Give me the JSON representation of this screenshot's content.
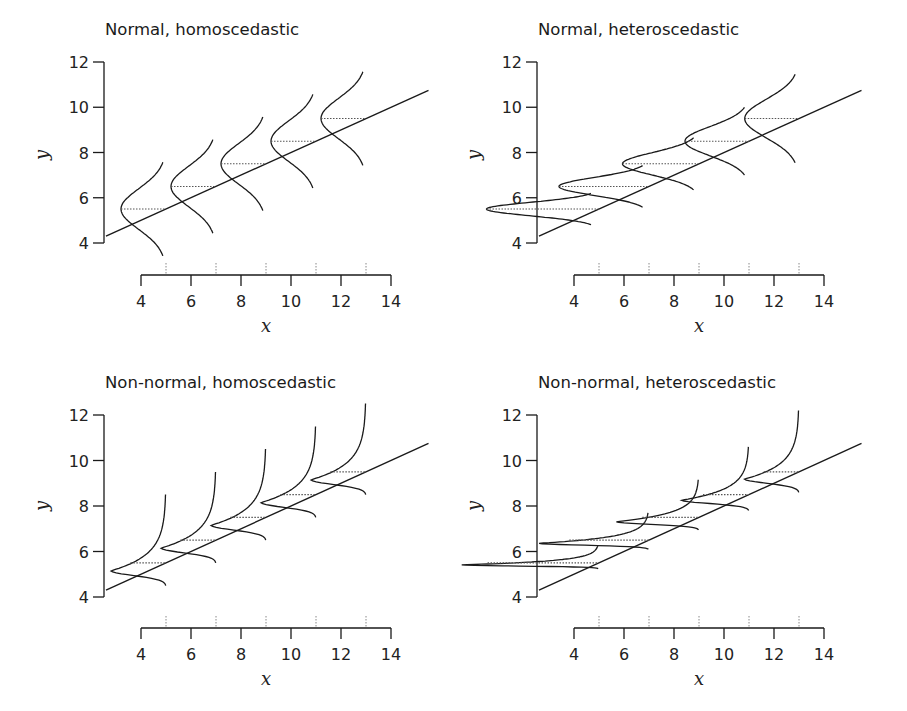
{
  "figure": {
    "background": "#ffffff",
    "line_color": "#1a1a1a",
    "dotted_color": "#555555"
  },
  "chart_data": [
    {
      "type": "line",
      "title": "Normal, homoscedastic",
      "xlabel": "x",
      "ylabel": "y",
      "xlim": [
        4,
        14
      ],
      "ylim": [
        4,
        12
      ],
      "xticks": [
        4,
        6,
        8,
        10,
        12,
        14
      ],
      "yticks": [
        4,
        6,
        8,
        10,
        12
      ],
      "grid": false,
      "regression_line": {
        "intercept": 3.0,
        "slope": 0.5,
        "x_range": [
          2.6,
          15.5
        ]
      },
      "distribution": "normal",
      "variance": "homoscedastic",
      "conditional_distributions": [
        {
          "x": 5,
          "mean": 5.5,
          "sd": 0.9
        },
        {
          "x": 7,
          "mean": 6.5,
          "sd": 0.9
        },
        {
          "x": 9,
          "mean": 7.5,
          "sd": 0.9
        },
        {
          "x": 11,
          "mean": 8.5,
          "sd": 0.9
        },
        {
          "x": 13,
          "mean": 9.5,
          "sd": 0.9
        }
      ],
      "rug_x": [
        5,
        7,
        9,
        11,
        13
      ]
    },
    {
      "type": "line",
      "title": "Normal, heteroscedastic",
      "xlabel": "x",
      "ylabel": "y",
      "xlim": [
        4,
        14
      ],
      "ylim": [
        4,
        12
      ],
      "xticks": [
        4,
        6,
        8,
        10,
        12,
        14
      ],
      "yticks": [
        4,
        6,
        8,
        10,
        12
      ],
      "grid": false,
      "regression_line": {
        "intercept": 3.0,
        "slope": 0.5,
        "x_range": [
          2.6,
          15.5
        ]
      },
      "distribution": "normal",
      "variance": "heteroscedastic",
      "conditional_distributions": [
        {
          "x": 5,
          "mean": 5.5,
          "sd": 0.3
        },
        {
          "x": 7,
          "mean": 6.5,
          "sd": 0.4
        },
        {
          "x": 9,
          "mean": 7.5,
          "sd": 0.5
        },
        {
          "x": 11,
          "mean": 8.5,
          "sd": 0.65
        },
        {
          "x": 13,
          "mean": 9.5,
          "sd": 0.85
        }
      ],
      "rug_x": [
        5,
        7,
        9,
        11,
        13
      ]
    },
    {
      "type": "line",
      "title": "Non-normal, homoscedastic",
      "xlabel": "x",
      "ylabel": "y",
      "xlim": [
        4,
        14
      ],
      "ylim": [
        4,
        12
      ],
      "xticks": [
        4,
        6,
        8,
        10,
        12,
        14
      ],
      "yticks": [
        4,
        6,
        8,
        10,
        12
      ],
      "grid": false,
      "regression_line": {
        "intercept": 3.0,
        "slope": 0.5,
        "x_range": [
          2.6,
          15.5
        ]
      },
      "distribution": "skewed",
      "variance": "homoscedastic",
      "conditional_distributions": [
        {
          "x": 5,
          "mean": 5.5,
          "scale": 1.0
        },
        {
          "x": 7,
          "mean": 6.5,
          "scale": 1.0
        },
        {
          "x": 9,
          "mean": 7.5,
          "scale": 1.0
        },
        {
          "x": 11,
          "mean": 8.5,
          "scale": 1.0
        },
        {
          "x": 13,
          "mean": 9.5,
          "scale": 1.0
        }
      ],
      "rug_x": [
        5,
        7,
        9,
        11,
        13
      ]
    },
    {
      "type": "line",
      "title": "Non-normal, heteroscedastic",
      "xlabel": "x",
      "ylabel": "y",
      "xlim": [
        4,
        14
      ],
      "ylim": [
        4,
        12
      ],
      "xticks": [
        4,
        6,
        8,
        10,
        12,
        14
      ],
      "yticks": [
        4,
        6,
        8,
        10,
        12
      ],
      "grid": false,
      "regression_line": {
        "intercept": 3.0,
        "slope": 0.5,
        "x_range": [
          2.6,
          15.5
        ]
      },
      "distribution": "skewed",
      "variance": "heteroscedastic",
      "conditional_distributions": [
        {
          "x": 5,
          "mean": 5.5,
          "scale": 0.25
        },
        {
          "x": 7,
          "mean": 6.5,
          "scale": 0.4
        },
        {
          "x": 9,
          "mean": 7.5,
          "scale": 0.55
        },
        {
          "x": 11,
          "mean": 8.5,
          "scale": 0.7
        },
        {
          "x": 13,
          "mean": 9.5,
          "scale": 0.9
        }
      ],
      "rug_x": [
        5,
        7,
        9,
        11,
        13
      ]
    }
  ],
  "panels": [
    {
      "title": "Normal, homoscedastic"
    },
    {
      "title": "Normal, heteroscedastic"
    },
    {
      "title": "Non-normal, homoscedastic"
    },
    {
      "title": "Non-normal, heteroscedastic"
    }
  ]
}
